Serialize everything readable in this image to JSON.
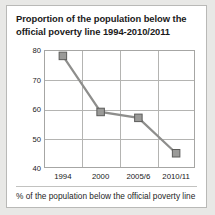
{
  "figure": {
    "title": "Proportion of the population below the official poverty line 1994-2010/2011",
    "caption": "% of the population below the official poverty line"
  },
  "style": {
    "marker_fill": "#9a9a98",
    "marker_stroke": "#5c5c5a",
    "line_color": "#8e8e8c",
    "grid_color": "#b4b4b2",
    "axis_color": "#a6a6a4",
    "panel_background": "#ffffff",
    "page_background": "#e8e8e6"
  },
  "chart_data": {
    "type": "line",
    "title": "Proportion of the population below the official poverty line 1994-2010/2011",
    "xlabel": "",
    "ylabel": "",
    "categories": [
      "1994",
      "2000",
      "2005/6",
      "2010/11"
    ],
    "values": [
      78,
      59,
      57,
      45
    ],
    "ylim": [
      40,
      80
    ],
    "yticks": [
      40,
      50,
      60,
      70,
      80
    ],
    "ytick_labels": [
      "40",
      "50",
      "60",
      "70",
      "80"
    ],
    "grid": true,
    "legend": "none",
    "series": [
      {
        "name": "% of the population below the official poverty line",
        "values": [
          78,
          59,
          57,
          45
        ]
      }
    ]
  }
}
